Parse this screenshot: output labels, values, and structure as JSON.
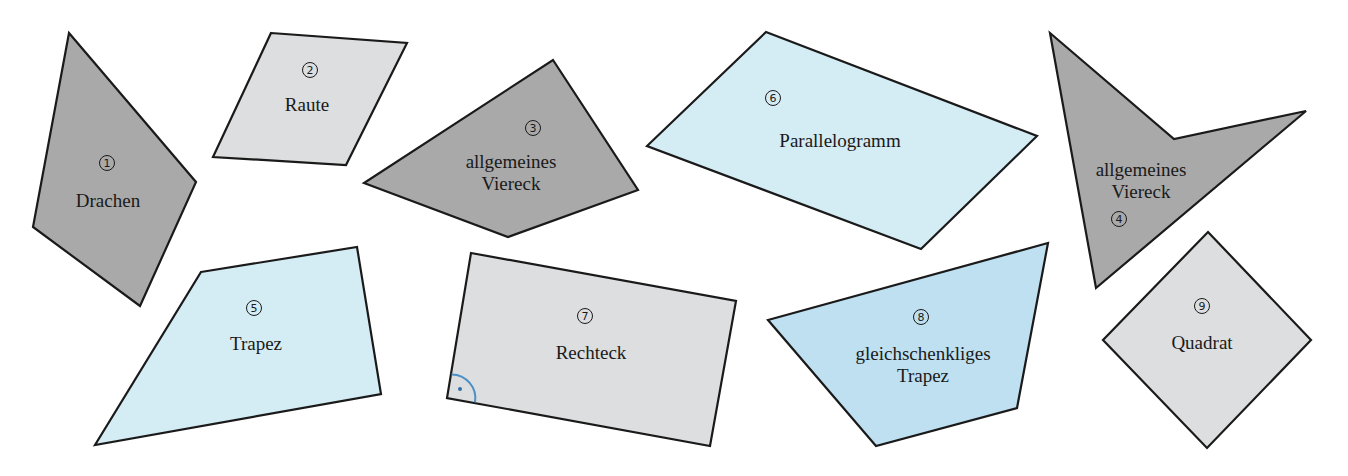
{
  "figure": {
    "shapes": [
      {
        "id": "drachen",
        "number": "1",
        "lines": [
          "Drachen"
        ],
        "fill": "#a9a9a9"
      },
      {
        "id": "raute",
        "number": "2",
        "lines": [
          "Raute"
        ],
        "fill": "#dcdedf"
      },
      {
        "id": "allgemeines-viereck-3",
        "number": "3",
        "lines": [
          "allgemeines",
          "Viereck"
        ],
        "fill": "#a9a9a9"
      },
      {
        "id": "allgemeines-viereck-4",
        "number": "4",
        "lines": [
          "allgemeines",
          "Viereck"
        ],
        "fill": "#a9a9a9"
      },
      {
        "id": "trapez",
        "number": "5",
        "lines": [
          "Trapez"
        ],
        "fill": "#d4ecf4"
      },
      {
        "id": "parallelogramm",
        "number": "6",
        "lines": [
          "Parallelogramm"
        ],
        "fill": "#d4ecf4"
      },
      {
        "id": "rechteck",
        "number": "7",
        "lines": [
          "Rechteck"
        ],
        "fill": "#dcdedf",
        "right_angle_mark_color": "#4a90c8"
      },
      {
        "id": "gleichschenkliges-trapez",
        "number": "8",
        "lines": [
          "gleichschenkliges",
          "Trapez"
        ],
        "fill": "#bfe0f0"
      },
      {
        "id": "quadrat",
        "number": "9",
        "lines": [
          "Quadrat"
        ],
        "fill": "#dcdedf"
      }
    ]
  }
}
